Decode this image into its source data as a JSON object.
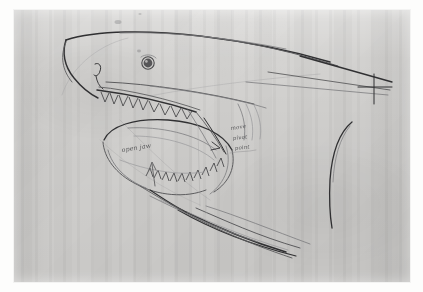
{
  "image": {
    "medium": "pencil sketch on textured grey paper",
    "subject": "shark head in profile with open jaws",
    "orientation": "landscape"
  },
  "paper": {
    "base_color": "#d5d4d2",
    "margin_color": "#fdfdfc",
    "texture": "vertical grain striations"
  },
  "pencil": {
    "dark": "#303032",
    "mid": "#5d5d5f",
    "light": "#7d7d80",
    "faint": "#9a9a9c"
  },
  "annotations": [
    {
      "id": "open-jaw",
      "text": "open jaw",
      "x": 122,
      "y": 152
    },
    {
      "id": "move",
      "text": "move",
      "x": 231,
      "y": 130
    },
    {
      "id": "pivot",
      "text": "pivot",
      "x": 233,
      "y": 140
    },
    {
      "id": "point",
      "text": "point",
      "x": 235,
      "y": 150
    }
  ],
  "features": [
    {
      "name": "snout",
      "label": "pointed snout"
    },
    {
      "name": "eye",
      "label": "eye"
    },
    {
      "name": "upper-jaw-teeth",
      "label": "upper jaw teeth"
    },
    {
      "name": "lower-jaw-teeth",
      "label": "lower jaw teeth"
    },
    {
      "name": "gill-slits",
      "label": "gill slits"
    },
    {
      "name": "pectoral-fin",
      "label": "pectoral fin"
    },
    {
      "name": "belly-lines",
      "label": "belly contour lines"
    },
    {
      "name": "pivot-cross",
      "label": "pivot cross mark"
    }
  ]
}
